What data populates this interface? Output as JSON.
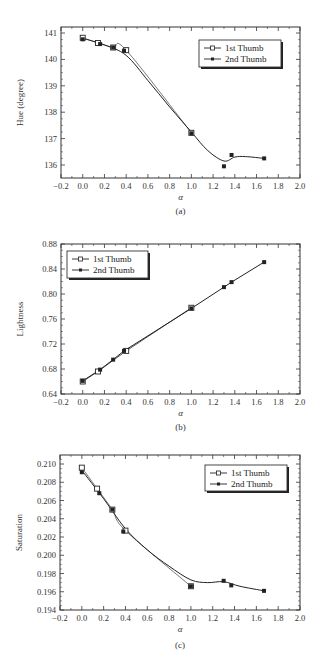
{
  "chart_data": [
    {
      "id": "a",
      "type": "line",
      "caption": "(a)",
      "xlabel": "α",
      "ylabel": "Hue (degree)",
      "xlim": [
        -0.2,
        2.0
      ],
      "ylim": [
        135.5,
        141.2
      ],
      "xticks": [
        "-0.2",
        "0.0",
        "0.2",
        "0.4",
        "0.6",
        "0.8",
        "1.0",
        "1.2",
        "1.4",
        "1.6",
        "1.8",
        "2.0"
      ],
      "yticks": [
        "136",
        "137",
        "138",
        "139",
        "140",
        "141"
      ],
      "legend": {
        "position": "upper right",
        "entries": [
          "1st Thumb",
          "2nd Thumb"
        ]
      },
      "grid": false,
      "series": [
        {
          "name": "1st Thumb",
          "marker": "open-square",
          "x": [
            0.0,
            0.14,
            0.28,
            0.4,
            1.0
          ],
          "y": [
            140.82,
            140.62,
            140.45,
            140.35,
            137.22
          ]
        },
        {
          "name": "2nd Thumb",
          "marker": "filled-square",
          "x": [
            0.0,
            0.16,
            0.28,
            0.38,
            1.0,
            1.3,
            1.37,
            1.67
          ],
          "y": [
            140.76,
            140.58,
            140.45,
            140.33,
            137.2,
            135.95,
            136.38,
            136.25
          ]
        }
      ],
      "fit_curve": {
        "x": [
          0.0,
          0.2,
          0.4,
          0.6,
          0.8,
          1.0,
          1.15,
          1.3,
          1.4,
          1.5,
          1.67
        ],
        "y": [
          140.8,
          140.55,
          140.15,
          139.2,
          138.2,
          137.25,
          136.55,
          136.15,
          136.3,
          136.32,
          136.25
        ]
      }
    },
    {
      "id": "b",
      "type": "line",
      "caption": "(b)",
      "xlabel": "α",
      "ylabel": "Lightness",
      "xlim": [
        -0.2,
        2.0
      ],
      "ylim": [
        0.64,
        0.88
      ],
      "xticks": [
        "-0.2",
        "0.0",
        "0.2",
        "0.4",
        "0.6",
        "0.8",
        "1.0",
        "1.2",
        "1.4",
        "1.6",
        "1.8",
        "2.0"
      ],
      "yticks": [
        "0.64",
        "0.68",
        "0.72",
        "0.76",
        "0.80",
        "0.84",
        "0.88"
      ],
      "legend": {
        "position": "upper left",
        "entries": [
          "1st Thumb",
          "2nd Thumb"
        ]
      },
      "grid": false,
      "series": [
        {
          "name": "1st Thumb",
          "marker": "open-square",
          "x": [
            0.0,
            0.14,
            0.4,
            1.0
          ],
          "y": [
            0.66,
            0.676,
            0.709,
            0.778
          ]
        },
        {
          "name": "2nd Thumb",
          "marker": "filled-square",
          "x": [
            0.0,
            0.16,
            0.28,
            0.38,
            1.0,
            1.3,
            1.37,
            1.67
          ],
          "y": [
            0.661,
            0.679,
            0.695,
            0.709,
            0.777,
            0.811,
            0.819,
            0.851
          ]
        }
      ]
    },
    {
      "id": "c",
      "type": "line",
      "caption": "(c)",
      "xlabel": "α",
      "ylabel": "Saturation",
      "xlim": [
        -0.2,
        2.0
      ],
      "ylim": [
        0.194,
        0.2105
      ],
      "xticks": [
        "-0.2",
        "0.0",
        "0.2",
        "0.4",
        "0.6",
        "0.8",
        "1.0",
        "1.2",
        "1.4",
        "1.6",
        "1.8",
        "2.0"
      ],
      "yticks": [
        "0.194",
        "0.196",
        "0.198",
        "0.200",
        "0.202",
        "0.204",
        "0.206",
        "0.208",
        "0.210"
      ],
      "legend": {
        "position": "upper right",
        "entries": [
          "1st Thumb",
          "2nd Thumb"
        ]
      },
      "grid": false,
      "series": [
        {
          "name": "1st Thumb",
          "marker": "open-square",
          "x": [
            0.0,
            0.14,
            0.28,
            0.4,
            1.0
          ],
          "y": [
            0.2096,
            0.2073,
            0.205,
            0.2027,
            0.1966
          ]
        },
        {
          "name": "2nd Thumb",
          "marker": "filled-square",
          "x": [
            0.0,
            0.16,
            0.28,
            0.38,
            1.0,
            1.3,
            1.37,
            1.67
          ],
          "y": [
            0.2091,
            0.2068,
            0.205,
            0.2026,
            0.1966,
            0.1972,
            0.1967,
            0.1961
          ]
        }
      ],
      "fit_curve": {
        "x": [
          0.0,
          0.2,
          0.4,
          0.6,
          0.8,
          1.0,
          1.15,
          1.3,
          1.45,
          1.67
        ],
        "y": [
          0.2093,
          0.2062,
          0.2029,
          0.2006,
          0.1988,
          0.1973,
          0.197,
          0.1971,
          0.1966,
          0.1961
        ]
      }
    }
  ]
}
